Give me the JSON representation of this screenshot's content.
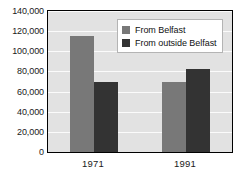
{
  "chart_data": {
    "type": "bar",
    "title": "",
    "xlabel": "",
    "ylabel": "",
    "categories": [
      "1971",
      "1991"
    ],
    "series": [
      {
        "name": "From Belfast",
        "color": "#787878",
        "values": [
          115000,
          70000
        ]
      },
      {
        "name": "From outside Belfast",
        "color": "#333333",
        "values": [
          70000,
          82000
        ]
      }
    ],
    "ylim": [
      0,
      140000
    ],
    "ytick_step": 20000,
    "ytick_labels": [
      "0",
      "20,000",
      "40,000",
      "60,000",
      "80,000",
      "100,000",
      "120,000",
      "140,000"
    ],
    "ytick_values": [
      0,
      20000,
      40000,
      60000,
      80000,
      100000,
      120000,
      140000
    ],
    "grid": true,
    "grid_color": "#fbfbfb",
    "plot_background": "#e2e2e2",
    "legend_position": "upper-right-inside"
  },
  "legend": {
    "entries": [
      {
        "label": "From Belfast",
        "color": "#787878"
      },
      {
        "label": "From outside Belfast",
        "color": "#333333"
      }
    ]
  },
  "axes": {
    "y_labels": [
      "140,000",
      "120,000",
      "100,000",
      "80,000",
      "60,000",
      "40,000",
      "20,000",
      "0"
    ],
    "x_labels": [
      "1971",
      "1991"
    ]
  }
}
